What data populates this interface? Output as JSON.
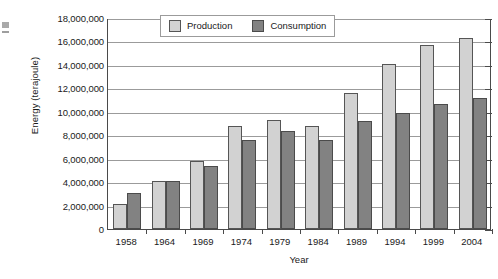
{
  "chart_data": {
    "type": "bar",
    "title": "",
    "xlabel": "Year",
    "ylabel": "Energy (terajoule)",
    "categories": [
      "1958",
      "1964",
      "1969",
      "1974",
      "1979",
      "1984",
      "1989",
      "1994",
      "1999",
      "2004"
    ],
    "series": [
      {
        "name": "Production",
        "color": "#d2d2d2",
        "values": [
          2100000,
          4100000,
          5800000,
          8800000,
          9300000,
          8800000,
          11600000,
          14100000,
          15700000,
          16300000
        ]
      },
      {
        "name": "Consumption",
        "color": "#828282",
        "values": [
          3100000,
          4100000,
          5400000,
          7600000,
          8400000,
          7600000,
          9200000,
          9900000,
          10700000,
          11200000
        ]
      }
    ],
    "ylim": [
      0,
      18000000
    ],
    "ytick_labels": [
      "18,000,000",
      "16,000,000",
      "14,000,000",
      "12,000,000",
      "10,000,000",
      "8,000,000",
      "6,000,000",
      "4,000,000",
      "2,000,000",
      "0"
    ],
    "ytick_values": [
      18000000,
      16000000,
      14000000,
      12000000,
      10000000,
      8000000,
      6000000,
      4000000,
      2000000,
      0
    ],
    "grid": true,
    "legend_position": "top-center"
  },
  "legend": {
    "items": [
      {
        "label": "Production"
      },
      {
        "label": "Consumption"
      }
    ]
  }
}
